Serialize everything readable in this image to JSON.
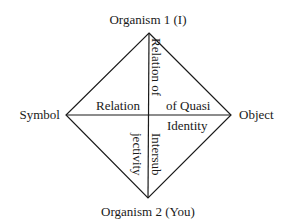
{
  "diagram": {
    "vertices": {
      "top": "Organism 1 (I)",
      "left": "Symbol",
      "right": "Object",
      "bottom": "Organism 2 (You)"
    },
    "inner_labels": {
      "relation": "Relation",
      "relation_of": "Relation of",
      "of_quasi": "of Quasi",
      "identity": "Identity",
      "intersub": "Intersub",
      "jectivity": "jectivity"
    },
    "colors": {
      "line": "#1a1a1a",
      "text": "#1a1a1a",
      "background": "#ffffff"
    }
  }
}
